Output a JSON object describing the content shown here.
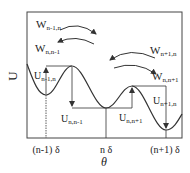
{
  "diagram": {
    "y_axis_label": "U",
    "x_axis_label": "θ",
    "x_ticks": [
      {
        "label": "(n-1) δ",
        "x": 46
      },
      {
        "label": "n δ",
        "x": 106
      },
      {
        "label": "(n+1) δ",
        "x": 166
      }
    ],
    "transition_rates": {
      "w_n_minus_1_n": {
        "base": "W",
        "sub": "n-1,n"
      },
      "w_n_n_minus_1": {
        "base": "W",
        "sub": "n,n-1"
      },
      "w_n_plus_1_n": {
        "base": "W",
        "sub": "n+1,n"
      },
      "w_n_n_plus_1": {
        "base": "W",
        "sub": "n,n+1"
      }
    },
    "barriers": {
      "u_n_minus_1_n": {
        "base": "U",
        "sub": "n-1,n"
      },
      "u_n_n_minus_1": {
        "base": "U",
        "sub": "n,n-1"
      },
      "u_n_n_plus_1": {
        "base": "U",
        "sub": "n,n+1"
      },
      "u_n_plus_1_n": {
        "base": "U",
        "sub": "n+1,n"
      }
    },
    "colors": {
      "line": "#333333",
      "background": "#ffffff"
    }
  }
}
